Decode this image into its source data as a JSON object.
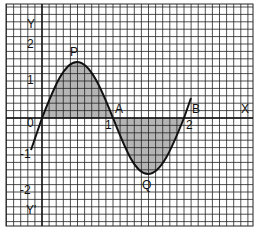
{
  "figure": {
    "axes": {
      "x_label": "X",
      "y_label": "Y",
      "y_neg_label": "Y'",
      "x_ticks": [
        "0",
        "1",
        "2"
      ],
      "y_ticks": [
        "2",
        "1",
        "-1",
        "-2"
      ]
    },
    "points": {
      "P": "P",
      "Q": "Q",
      "A": "A",
      "B": "B"
    },
    "colors": {
      "grid": "#222222",
      "curve": "#111111",
      "shade": "#a8a8a8",
      "background": "#ffffff"
    }
  }
}
